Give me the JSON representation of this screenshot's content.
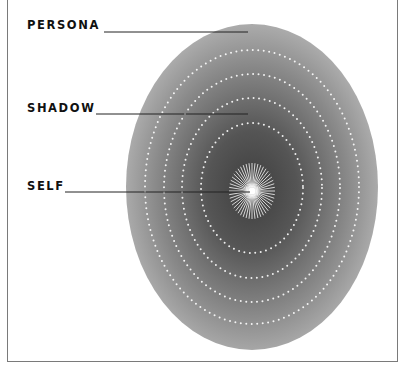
{
  "diagram": {
    "labels": {
      "persona": "PERSONA",
      "shadow": "SHADOW",
      "self": "SELF"
    },
    "colors": {
      "ellipse_outer": "#a9a9a9",
      "ellipse_inner": "#4a4a4a",
      "dots": "#ffffff",
      "leader_lines": "#222222",
      "border": "#7a7a7a"
    },
    "rings": 4
  }
}
